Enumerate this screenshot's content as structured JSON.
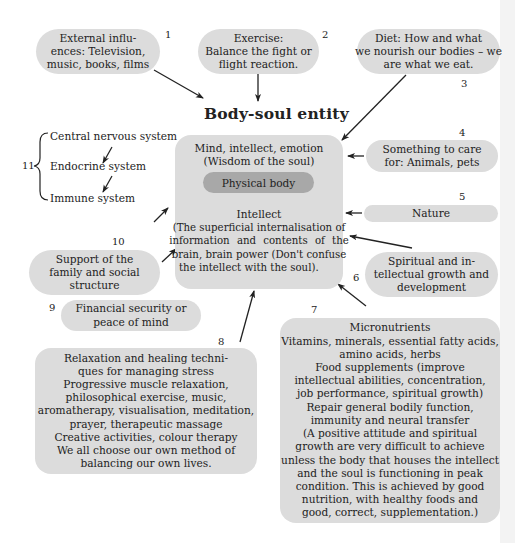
{
  "diagram": {
    "title": "Body-soul entity",
    "center": {
      "top_lines": [
        "Mind, intellect, emotion",
        "(Wisdom of the soul)"
      ],
      "inner_label": "Physical body",
      "intellect_heading": "Intellect",
      "intellect_text_lines": [
        "(The superficial internalisation of",
        "information and contents of the",
        "brain, brain power (Don't confuse",
        "the intellect with the soul)."
      ]
    },
    "nodes": [
      {
        "number": "1",
        "lines": [
          "External influ-",
          "ences: Television,",
          "music, books, films"
        ]
      },
      {
        "number": "2",
        "lines": [
          "Exercise:",
          "Balance the fight or",
          "flight reaction."
        ]
      },
      {
        "number": "3",
        "lines": [
          "Diet: How and what",
          "we nourish our bodies – we",
          "are what we eat."
        ]
      },
      {
        "number": "4",
        "lines": [
          "Something to care",
          "for: Animals, pets"
        ]
      },
      {
        "number": "5",
        "lines": [
          "Nature"
        ]
      },
      {
        "number": "6",
        "lines": [
          "Spiritual and in-",
          "tellectual growth and",
          "development"
        ]
      },
      {
        "number": "7",
        "lines": [
          "Micronutrients",
          "Vitamins, minerals, essential fatty acids,",
          "amino acids, herbs",
          "Food supplements (improve",
          "intellectual abilities, concentration,",
          "job performance, spiritual growth)",
          "Repair general bodily function,",
          "immunity and neural transfer",
          "(A positive attitude and spiritual",
          "growth are very difficult to achieve",
          "unless the body that houses the intellect",
          "and the soul is functioning in peak",
          "condition. This is achieved by good",
          "nutrition, with healthy foods and",
          "good, correct, supplementation.)"
        ]
      },
      {
        "number": "8",
        "lines": [
          "Relaxation and healing techni-",
          "ques for managing stress",
          "Progressive muscle relaxation,",
          "philosophical exercise, music,",
          "aromatherapy, visualisation, meditation,",
          "prayer, therapeutic massage",
          "Creative activities, colour therapy",
          "We all choose our own method of",
          "balancing our own lives."
        ]
      },
      {
        "number": "9",
        "lines": [
          "Financial security or",
          "peace of mind"
        ]
      },
      {
        "number": "10",
        "lines": [
          "Support of the",
          "family and social",
          "structure"
        ]
      },
      {
        "number": "11",
        "lines": [
          "Central nervous system",
          "Endocrine system",
          "Immune system"
        ]
      }
    ],
    "colors": {
      "box_fill": "#dcdcdc",
      "physical_body_fill": "#a8a8a8",
      "text": "#222222",
      "arrow": "#222222"
    }
  }
}
